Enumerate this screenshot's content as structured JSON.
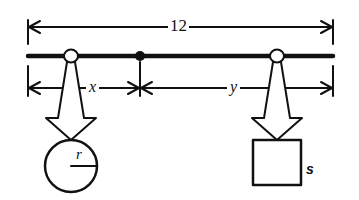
{
  "diagram": {
    "type": "lever / balance beam",
    "colors": {
      "stroke": "#111111",
      "background": "#ffffff"
    },
    "overall_length": {
      "label": "12"
    },
    "segments": [
      {
        "name": "left",
        "label": "x"
      },
      {
        "name": "right",
        "label": "y"
      }
    ],
    "loads": [
      {
        "shape": "circle",
        "dimension_label": "r"
      },
      {
        "shape": "square",
        "dimension_label": "s"
      }
    ],
    "fulcrum": {
      "shape": "filled dot"
    },
    "supports": [
      {
        "shape": "hollow ring",
        "position": "left"
      },
      {
        "shape": "hollow ring",
        "position": "right"
      }
    ]
  }
}
